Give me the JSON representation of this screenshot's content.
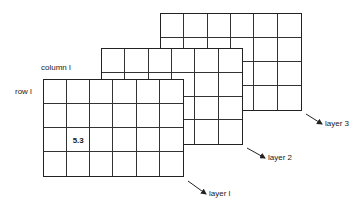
{
  "diagram": {
    "grid": {
      "columns": 6,
      "rows": 4
    },
    "layers": [
      {
        "name": "layer 3",
        "label": "layer 3",
        "x": 160,
        "y": 13,
        "width": 142,
        "height": 98
      },
      {
        "name": "layer 2",
        "label": "layer 2",
        "x": 101,
        "y": 48,
        "width": 142,
        "height": 97
      },
      {
        "name": "layer 1",
        "label": "layer l",
        "x": 43,
        "y": 79,
        "width": 141,
        "height": 98
      }
    ],
    "column_label": "column l",
    "row_label": "row l",
    "cell_value": {
      "text": "5.3",
      "row": 2,
      "column": 2
    }
  }
}
